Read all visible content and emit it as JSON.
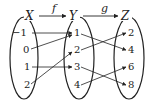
{
  "diagram": {
    "type": "function-composition-mapping",
    "sets": [
      {
        "name": "X",
        "elements": [
          "−1",
          "0",
          "1",
          "2"
        ]
      },
      {
        "name": "Y",
        "elements": [
          "1",
          "2",
          "3",
          "4"
        ]
      },
      {
        "name": "Z",
        "elements": [
          "2",
          "4",
          "6",
          "8"
        ]
      }
    ],
    "functions": [
      {
        "name": "f",
        "from": "X",
        "to": "Y",
        "mappings": [
          [
            "−1",
            "1"
          ],
          [
            "0",
            "1"
          ],
          [
            "1",
            "3"
          ],
          [
            "2",
            "2"
          ]
        ]
      },
      {
        "name": "g",
        "from": "Y",
        "to": "Z",
        "mappings": [
          [
            "1",
            "4"
          ],
          [
            "2",
            "2"
          ],
          [
            "3",
            "8"
          ],
          [
            "4",
            "6"
          ]
        ]
      }
    ],
    "colors": {
      "stroke": "#222222",
      "background": "#ffffff"
    }
  }
}
